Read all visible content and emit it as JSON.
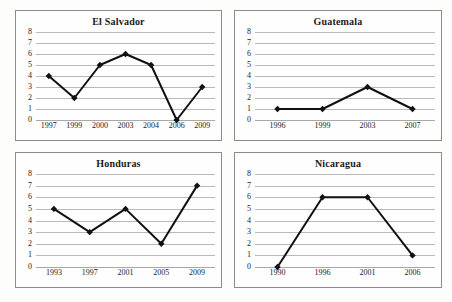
{
  "figure": {
    "panel_count": 4,
    "layout": "2x2",
    "line_color": "#111111",
    "grid_color": "#b9b9b9",
    "border_color": "#8c8c8c",
    "background": "#fefefe"
  },
  "chart_data": [
    {
      "type": "line",
      "title": "El Salvador",
      "xlabel": "",
      "ylabel": "",
      "x": [
        "1997",
        "1999",
        "2000",
        "2003",
        "2004",
        "2006",
        "2009"
      ],
      "values": [
        4,
        2,
        5,
        6,
        5,
        0,
        3
      ],
      "yticks": [
        8,
        7,
        6,
        5,
        4,
        3,
        2,
        1,
        0
      ],
      "ylim": [
        0,
        8
      ],
      "grid": true,
      "legend": "none",
      "marker": "diamond"
    },
    {
      "type": "line",
      "title": "Guatemala",
      "xlabel": "",
      "ylabel": "",
      "x": [
        "1996",
        "1999",
        "2003",
        "2007"
      ],
      "values": [
        1,
        1,
        3,
        1
      ],
      "yticks": [
        8,
        7,
        6,
        5,
        4,
        3,
        2,
        1,
        0
      ],
      "ylim": [
        0,
        8
      ],
      "grid": true,
      "legend": "none",
      "marker": "diamond"
    },
    {
      "type": "line",
      "title": "Honduras",
      "xlabel": "",
      "ylabel": "",
      "x": [
        "1993",
        "1997",
        "2001",
        "2005",
        "2009"
      ],
      "values": [
        5,
        3,
        5,
        2,
        7
      ],
      "yticks": [
        8,
        7,
        6,
        5,
        4,
        3,
        2,
        1,
        0
      ],
      "ylim": [
        0,
        8
      ],
      "grid": true,
      "legend": "none",
      "marker": "diamond"
    },
    {
      "type": "line",
      "title": "Nicaragua",
      "xlabel": "",
      "ylabel": "",
      "x": [
        "1990",
        "1996",
        "2001",
        "2006"
      ],
      "values": [
        0,
        6,
        6,
        1
      ],
      "yticks": [
        8,
        7,
        6,
        5,
        4,
        3,
        2,
        1,
        0
      ],
      "ylim": [
        0,
        8
      ],
      "grid": true,
      "legend": "none",
      "marker": "diamond"
    }
  ]
}
